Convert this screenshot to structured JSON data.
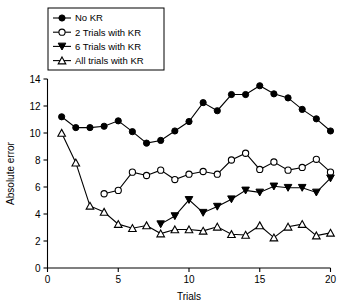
{
  "chart_data": {
    "type": "line",
    "title": "",
    "xlabel": "Trials",
    "ylabel": "Absolute error",
    "xlim": [
      0,
      20
    ],
    "ylim": [
      0,
      14
    ],
    "xticks": [
      0,
      5,
      10,
      15,
      20
    ],
    "yticks": [
      0,
      2,
      4,
      6,
      8,
      10,
      12,
      14
    ],
    "xtick_labels": [
      "0",
      "5",
      "10",
      "15",
      "20"
    ],
    "ytick_labels": [
      "0",
      "2",
      "4",
      "6",
      "8",
      "10",
      "12",
      "14"
    ],
    "grid": false,
    "legend_position": "upper-left",
    "x": [
      1,
      2,
      3,
      4,
      5,
      6,
      7,
      8,
      9,
      10,
      11,
      12,
      13,
      14,
      15,
      16,
      17,
      18,
      19,
      20
    ],
    "series": [
      {
        "name": "No KR",
        "marker": "filled-circle",
        "x": [
          1,
          2,
          3,
          4,
          5,
          6,
          7,
          8,
          9,
          10,
          11,
          12,
          13,
          14,
          15,
          16,
          17,
          18,
          19,
          20
        ],
        "values": [
          11.2,
          10.4,
          10.4,
          10.5,
          10.9,
          10.1,
          9.25,
          9.45,
          10.15,
          10.85,
          12.25,
          11.65,
          12.85,
          12.85,
          13.5,
          12.9,
          12.6,
          11.75,
          11.05,
          10.15
        ]
      },
      {
        "name": "2 Trials with KR",
        "marker": "open-circle",
        "x": [
          4,
          5,
          6,
          7,
          8,
          9,
          10,
          11,
          12,
          13,
          14,
          15,
          16,
          17,
          18,
          19,
          20
        ],
        "values": [
          5.5,
          5.75,
          7.1,
          6.85,
          7.25,
          6.55,
          6.95,
          7.15,
          6.95,
          8.0,
          8.5,
          7.3,
          7.85,
          7.25,
          7.45,
          8.05,
          7.1
        ]
      },
      {
        "name": "6 Trials with KR",
        "marker": "filled-triangle-down",
        "x": [
          8,
          9,
          10,
          11,
          12,
          13,
          14,
          15,
          16,
          17,
          18,
          19,
          20
        ],
        "values": [
          3.25,
          3.85,
          5.05,
          4.1,
          4.55,
          5.1,
          5.75,
          5.6,
          6.05,
          5.95,
          5.95,
          5.6,
          6.65
        ]
      },
      {
        "name": "All trials with KR",
        "marker": "open-triangle-up",
        "x": [
          1,
          2,
          3,
          4,
          5,
          6,
          7,
          8,
          9,
          10,
          11,
          12,
          13,
          14,
          15,
          16,
          17,
          18,
          19,
          20
        ],
        "values": [
          10.0,
          7.8,
          4.6,
          4.15,
          3.25,
          2.95,
          3.15,
          2.55,
          2.85,
          2.85,
          2.75,
          3.05,
          2.5,
          2.45,
          3.15,
          2.25,
          3.05,
          3.25,
          2.4,
          2.6
        ]
      }
    ]
  },
  "legend": {
    "items": [
      {
        "label": "No KR",
        "marker": "filled-circle"
      },
      {
        "label": "2 Trials with KR",
        "marker": "open-circle"
      },
      {
        "label": "6 Trials with KR",
        "marker": "filled-triangle-down"
      },
      {
        "label": "All trials with KR",
        "marker": "open-triangle-up"
      }
    ]
  }
}
